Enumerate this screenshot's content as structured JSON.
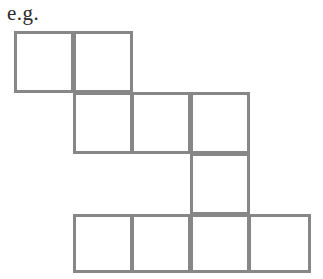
{
  "label": {
    "text": "e.g."
  },
  "figure": {
    "name": "polyomino-net",
    "line_color": "#878787",
    "background_color": "#ffffff",
    "line_width_px": 3,
    "cell_size_px": 59,
    "cell_count": 10,
    "origin": {
      "x": 14,
      "y": 31
    },
    "columns": [
      14,
      73,
      131,
      190,
      248,
      310
    ],
    "rows": [
      31,
      92,
      153,
      214,
      272
    ],
    "cells": [
      {
        "id": "r1c1",
        "row": 1,
        "col": 1,
        "x": 14,
        "y": 31,
        "w": 60,
        "h": 62
      },
      {
        "id": "r1c2",
        "row": 1,
        "col": 2,
        "x": 73,
        "y": 31,
        "w": 60,
        "h": 62
      },
      {
        "id": "r2c2",
        "row": 2,
        "col": 2,
        "x": 73,
        "y": 92,
        "w": 60,
        "h": 62
      },
      {
        "id": "r2c3",
        "row": 2,
        "col": 3,
        "x": 131,
        "y": 92,
        "w": 60,
        "h": 62
      },
      {
        "id": "r2c4",
        "row": 2,
        "col": 4,
        "x": 190,
        "y": 92,
        "w": 60,
        "h": 62
      },
      {
        "id": "r3c4",
        "row": 3,
        "col": 4,
        "x": 190,
        "y": 153,
        "w": 60,
        "h": 62
      },
      {
        "id": "r4c2",
        "row": 4,
        "col": 2,
        "x": 73,
        "y": 214,
        "w": 60,
        "h": 59
      },
      {
        "id": "r4c3",
        "row": 4,
        "col": 3,
        "x": 131,
        "y": 214,
        "w": 60,
        "h": 59
      },
      {
        "id": "r4c4",
        "row": 4,
        "col": 4,
        "x": 190,
        "y": 214,
        "w": 60,
        "h": 59
      },
      {
        "id": "r4c5",
        "row": 4,
        "col": 5,
        "x": 248,
        "y": 214,
        "w": 63,
        "h": 59
      }
    ]
  }
}
